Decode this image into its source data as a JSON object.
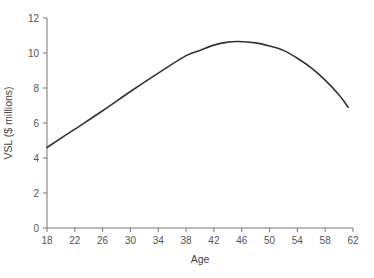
{
  "chart_data": {
    "type": "line",
    "title": "",
    "xlabel": "Age",
    "ylabel": "VSL ($ millions)",
    "xlim": [
      18,
      62
    ],
    "ylim": [
      0,
      12
    ],
    "xticks": [
      18,
      22,
      26,
      30,
      34,
      38,
      42,
      46,
      50,
      54,
      58,
      62
    ],
    "yticks": [
      0,
      2,
      4,
      6,
      8,
      10,
      12
    ],
    "grid": false,
    "legend": null,
    "series": [
      {
        "name": "VSL",
        "color": "#333333",
        "x": [
          18,
          22,
          26,
          30,
          34,
          38,
          40,
          42,
          44,
          45.5,
          48,
          50,
          52,
          54,
          56,
          58,
          60,
          61.3
        ],
        "y": [
          4.6,
          5.65,
          6.7,
          7.8,
          8.85,
          9.85,
          10.15,
          10.45,
          10.62,
          10.66,
          10.58,
          10.4,
          10.15,
          9.7,
          9.15,
          8.45,
          7.6,
          6.9
        ]
      }
    ]
  }
}
